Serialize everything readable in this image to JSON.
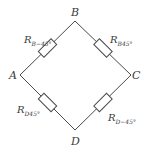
{
  "diagram": {
    "type": "bridge-circuit",
    "nodes": {
      "B": {
        "label": "B"
      },
      "A": {
        "label": "A"
      },
      "C": {
        "label": "C"
      },
      "D": {
        "label": "D"
      }
    },
    "resistors": [
      {
        "id": "AB",
        "symbol": "R",
        "subscript": "B−45°",
        "between": [
          "A",
          "B"
        ]
      },
      {
        "id": "BC",
        "symbol": "R",
        "subscript": "B45°",
        "between": [
          "B",
          "C"
        ]
      },
      {
        "id": "AD",
        "symbol": "R",
        "subscript": "D45°",
        "between": [
          "A",
          "D"
        ]
      },
      {
        "id": "DC",
        "symbol": "R",
        "subscript": "D−45°",
        "between": [
          "D",
          "C"
        ]
      }
    ],
    "colors": {
      "line": "#4a4a4a",
      "text": "#3a3a3a"
    }
  }
}
